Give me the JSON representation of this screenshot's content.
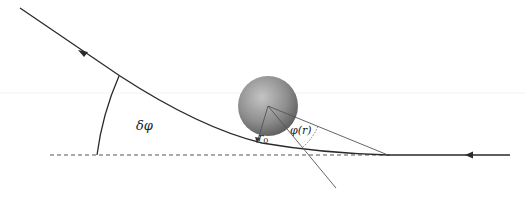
{
  "diagram": {
    "labels": {
      "deflection_angle": "δφ",
      "closest_approach": "r",
      "closest_approach_sub": "0",
      "polar_angle": "φ(r)"
    },
    "colors": {
      "trajectory": "#2a2a2a",
      "baseline": "#555555",
      "construction_lines": "#555555",
      "sphere_light": "#b0b0b0",
      "sphere_dark": "#5a5a5a"
    },
    "geometry": {
      "sphere_center": [
        268,
        106
      ],
      "sphere_radius": 30,
      "baseline_y": 155,
      "vertex": [
        388,
        155
      ]
    }
  }
}
